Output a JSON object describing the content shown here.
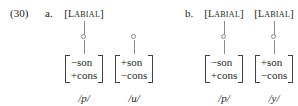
{
  "example": {
    "number": "(30)"
  },
  "subexamples": [
    {
      "label": "a.",
      "branches": [
        {
          "node_label": "[LABIAL]",
          "node_label_visible": true,
          "has_upper_line": true,
          "has_circle_node": true,
          "has_lower_line": true,
          "features": [
            "−son",
            "+cons"
          ],
          "phoneme": "/p/"
        },
        {
          "node_label": "[LABIAL]",
          "node_label_visible": false,
          "has_upper_line": false,
          "has_circle_node": true,
          "has_lower_line": true,
          "features": [
            "+son",
            "−cons"
          ],
          "phoneme": "/u/"
        }
      ]
    },
    {
      "label": "b.",
      "branches": [
        {
          "node_label": "[LABIAL]",
          "node_label_visible": true,
          "has_upper_line": true,
          "has_circle_node": true,
          "has_lower_line": true,
          "features": [
            "−son",
            "+cons"
          ],
          "phoneme": "/p/"
        },
        {
          "node_label": "[LABIAL]",
          "node_label_visible": true,
          "has_upper_line": true,
          "has_circle_node": true,
          "has_lower_line": true,
          "features": [
            "+son",
            "−cons"
          ],
          "phoneme": "/y/"
        }
      ]
    }
  ],
  "colors": {
    "text": "#231f20",
    "line": "#8d8a8b",
    "bracket": "#444041",
    "background": "#ffffff"
  }
}
